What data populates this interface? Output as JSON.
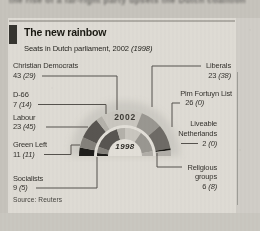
{
  "page": {
    "cropped_article_text": "the rise of a far-right party upsets the Dutch coalition",
    "source_note": "Source: Reuters"
  },
  "header": {
    "title": "The new rainbow",
    "subtitle": "Seats in Dutch parliament, 2002 ",
    "subtitle_prev_year": "(1998)"
  },
  "chart_data": {
    "type": "parliament-hemicycle",
    "title": "The new rainbow",
    "subtitle": "Seats in Dutch parliament, 2002 (1998)",
    "total_seats": 150,
    "ring_labels": {
      "outer": "2002",
      "inner": "1998"
    },
    "layout": "two concentric semicircle rings; outer ring = 2002 seats, inner ring = 1998 seats; parties ordered left to right",
    "parties": [
      {
        "name": "Socialists",
        "seats_2002": 9,
        "seats_1998": 5,
        "color": "#1d1c19"
      },
      {
        "name": "Green Left",
        "seats_2002": 11,
        "seats_1998": 11,
        "color": "#84817b"
      },
      {
        "name": "Labour",
        "seats_2002": 23,
        "seats_1998": 45,
        "color": "#575450"
      },
      {
        "name": "D-66",
        "seats_2002": 7,
        "seats_1998": 14,
        "color": "#b5b2ab"
      },
      {
        "name": "Christian Democrats",
        "seats_2002": 43,
        "seats_1998": 29,
        "color": "#cac7c0"
      },
      {
        "name": "Liberals",
        "seats_2002": 23,
        "seats_1998": 38,
        "color": "#9a9791"
      },
      {
        "name": "Pim Fortuyn List",
        "seats_2002": 26,
        "seats_1998": 0,
        "color": "#6e6b65"
      },
      {
        "name": "Liveable Netherlands",
        "seats_2002": 2,
        "seats_1998": 0,
        "color": "#181713"
      },
      {
        "name": "Religious groups",
        "seats_2002": 6,
        "seats_1998": 8,
        "color": "#b2afa9"
      }
    ]
  },
  "labels": {
    "cda_name": "Christian Democrats",
    "cda_value": "43",
    "cda_prev": "(29)",
    "d66_name": "D-66",
    "d66_value": "7",
    "d66_prev": "(14)",
    "labour_name": "Labour",
    "labour_value": "23",
    "labour_prev": "(45)",
    "gl_name": "Green Left",
    "gl_value": "11",
    "gl_prev": "(11)",
    "sp_name": "Socialists",
    "sp_value": "9",
    "sp_prev": "(5)",
    "lib_name": "Liberals",
    "lib_value": "23",
    "lib_prev": "(38)",
    "pfl_name": "Pim Fortuyn List",
    "pfl_value": "26",
    "pfl_prev": "(0)",
    "ln_name_line1": "Liveable",
    "ln_name_line2": "Netherlands",
    "ln_value": "2",
    "ln_prev": "(0)",
    "rel_name_line1": "Religious",
    "rel_name_line2": "groups",
    "rel_value": "6",
    "rel_prev": "(8)"
  }
}
